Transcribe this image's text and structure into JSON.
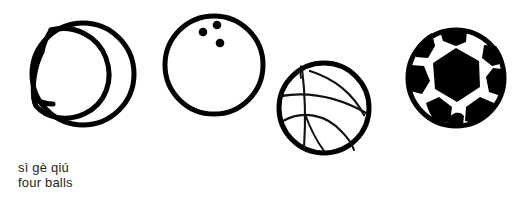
{
  "background_color": "#ffffff",
  "ink_color": "#000000",
  "caption": {
    "pinyin": "sì gè qiú",
    "english": "four balls",
    "text_color": "#231f20"
  },
  "illustration": {
    "alt": "four balls line drawing",
    "balls": [
      {
        "id": "tennis-ball",
        "label": "tennis ball",
        "center_x": 82,
        "center_y": 73,
        "radius": 50,
        "stroke_width": 5,
        "detail": "curved seam crescent"
      },
      {
        "id": "bowling-ball",
        "label": "bowling ball",
        "center_x": 214,
        "center_y": 65,
        "radius": 48,
        "stroke_width": 5,
        "detail": "three finger holes",
        "holes": [
          {
            "cx": 203,
            "cy": 32,
            "r": 4
          },
          {
            "cx": 217,
            "cy": 25,
            "r": 4
          },
          {
            "cx": 220,
            "cy": 43,
            "r": 4
          }
        ]
      },
      {
        "id": "basketball",
        "label": "basketball",
        "center_x": 324,
        "center_y": 108,
        "radius": 45,
        "stroke_width": 5,
        "detail": "sketchy seam lines"
      },
      {
        "id": "soccer-ball",
        "label": "soccer ball",
        "center_x": 456,
        "center_y": 78,
        "radius": 48,
        "stroke_width": 5,
        "detail": "black hexagon patches"
      }
    ]
  }
}
